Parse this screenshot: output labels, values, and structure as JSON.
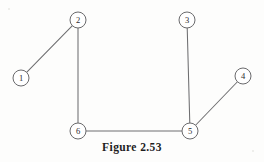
{
  "figure": {
    "caption": "Figure 2.53",
    "width": 264,
    "height": 162,
    "background_color": "#fdfdfc",
    "stroke_color": "#6e6e70",
    "label_color": "#2c2c2e",
    "caption_color": "#1d1d1f"
  },
  "chart_data": {
    "type": "diagram",
    "subtype": "undirected-graph",
    "title": "Figure 2.53",
    "node_radius": 8,
    "nodes": [
      {
        "id": "1",
        "label": "1",
        "x": 21,
        "y": 78
      },
      {
        "id": "2",
        "label": "2",
        "x": 78,
        "y": 20
      },
      {
        "id": "3",
        "label": "3",
        "x": 187,
        "y": 20
      },
      {
        "id": "4",
        "label": "4",
        "x": 243,
        "y": 76
      },
      {
        "id": "5",
        "label": "5",
        "x": 190,
        "y": 131
      },
      {
        "id": "6",
        "label": "6",
        "x": 78,
        "y": 131
      }
    ],
    "edges": [
      {
        "from": "1",
        "to": "2"
      },
      {
        "from": "2",
        "to": "6"
      },
      {
        "from": "6",
        "to": "5"
      },
      {
        "from": "5",
        "to": "3"
      },
      {
        "from": "5",
        "to": "4"
      }
    ],
    "degree": {
      "1": 1,
      "2": 2,
      "3": 1,
      "4": 1,
      "5": 3,
      "6": 2
    },
    "node_count": 6,
    "edge_count": 5,
    "directed": false,
    "weighted": false,
    "labeled_edges": false
  }
}
